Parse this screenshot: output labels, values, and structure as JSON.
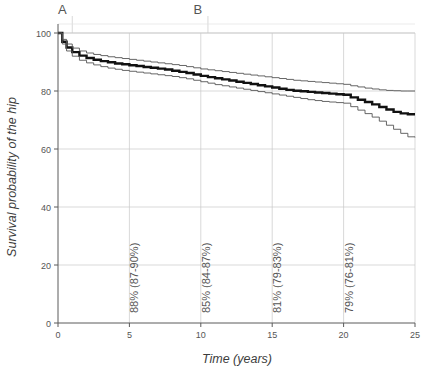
{
  "chart_data": {
    "type": "line",
    "title": "",
    "xlabel": "Time (years)",
    "ylabel": "Survival probability of the hip",
    "xlim": [
      0,
      25
    ],
    "ylim": [
      0,
      100
    ],
    "xticks": [
      0,
      5,
      10,
      15,
      20,
      25
    ],
    "yticks": [
      0,
      20,
      40,
      60,
      80,
      100
    ],
    "grid": true,
    "legend": "none",
    "panel_letters": [
      {
        "label": "A",
        "x": 1.0
      },
      {
        "label": "B",
        "x": 10.5
      }
    ],
    "annotations": [
      {
        "text": "88% (87-90%)",
        "x": 5,
        "value": 88,
        "ci_low": 87,
        "ci_high": 90
      },
      {
        "text": "85% (84-87%)",
        "x": 10,
        "value": 85,
        "ci_low": 84,
        "ci_high": 87
      },
      {
        "text": "81% (79-83%)",
        "x": 15,
        "value": 81,
        "ci_low": 79,
        "ci_high": 83
      },
      {
        "text": "79% (76-81%)",
        "x": 20,
        "value": 79,
        "ci_low": 76,
        "ci_high": 81
      }
    ],
    "series": [
      {
        "name": "Survival estimate",
        "style": "bold",
        "color": "#111111",
        "x": [
          0,
          0.3,
          0.6,
          1.0,
          1.5,
          2.0,
          2.5,
          3.0,
          3.5,
          4.0,
          4.5,
          5.0,
          5.5,
          6.0,
          6.5,
          7.0,
          7.5,
          8.0,
          8.5,
          9.0,
          9.5,
          10.0,
          10.5,
          11.0,
          11.5,
          12.0,
          12.5,
          13.0,
          13.5,
          14.0,
          14.5,
          15.0,
          15.5,
          16.0,
          16.5,
          17.0,
          17.5,
          18.0,
          18.5,
          19.0,
          19.5,
          20.0,
          20.5,
          21.0,
          21.5,
          22.0,
          22.5,
          23.0,
          23.5,
          24.0,
          24.5,
          25.0
        ],
        "values": [
          100,
          97.0,
          95.0,
          93.4,
          92.2,
          91.4,
          90.8,
          90.3,
          89.9,
          89.5,
          89.2,
          88.9,
          88.6,
          88.3,
          88.0,
          87.7,
          87.4,
          87.0,
          86.6,
          86.2,
          85.7,
          85.2,
          84.8,
          84.4,
          84.0,
          83.6,
          83.2,
          82.8,
          82.4,
          82.0,
          81.6,
          81.2,
          80.8,
          80.4,
          80.1,
          79.9,
          79.7,
          79.5,
          79.3,
          79.1,
          78.9,
          78.7,
          77.8,
          77.0,
          76.2,
          75.4,
          74.5,
          73.6,
          72.8,
          72.3,
          72.0,
          72.0
        ]
      },
      {
        "name": "Upper 95% CI",
        "style": "thin",
        "color": "#555555",
        "x": [
          0,
          0.3,
          0.6,
          1.0,
          1.5,
          2.0,
          2.5,
          3.0,
          3.5,
          4.0,
          4.5,
          5.0,
          5.5,
          6.0,
          6.5,
          7.0,
          7.5,
          8.0,
          8.5,
          9.0,
          9.5,
          10.0,
          10.5,
          11.0,
          11.5,
          12.0,
          12.5,
          13.0,
          13.5,
          14.0,
          14.5,
          15.0,
          15.5,
          16.0,
          16.5,
          17.0,
          17.5,
          18.0,
          18.5,
          19.0,
          19.5,
          20.0,
          20.5,
          21.0,
          21.5,
          22.0,
          22.5,
          23.0,
          23.5,
          24.0,
          24.5,
          25.0
        ],
        "values": [
          100,
          97.8,
          96.2,
          94.8,
          93.8,
          93.1,
          92.6,
          92.2,
          91.8,
          91.5,
          91.2,
          90.9,
          90.6,
          90.3,
          90.0,
          89.7,
          89.4,
          89.1,
          88.8,
          88.4,
          88.0,
          87.6,
          87.3,
          87.0,
          86.7,
          86.4,
          86.1,
          85.8,
          85.5,
          85.2,
          84.9,
          84.6,
          84.3,
          84.0,
          83.7,
          83.5,
          83.3,
          83.1,
          82.9,
          82.7,
          82.5,
          82.3,
          81.8,
          81.4,
          81.0,
          80.7,
          80.4,
          80.2,
          80.1,
          80.0,
          80.0,
          80.0
        ]
      },
      {
        "name": "Lower 95% CI",
        "style": "thin",
        "color": "#555555",
        "x": [
          0,
          0.3,
          0.6,
          1.0,
          1.5,
          2.0,
          2.5,
          3.0,
          3.5,
          4.0,
          4.5,
          5.0,
          5.5,
          6.0,
          6.5,
          7.0,
          7.5,
          8.0,
          8.5,
          9.0,
          9.5,
          10.0,
          10.5,
          11.0,
          11.5,
          12.0,
          12.5,
          13.0,
          13.5,
          14.0,
          14.5,
          15.0,
          15.5,
          16.0,
          16.5,
          17.0,
          17.5,
          18.0,
          18.5,
          19.0,
          19.5,
          20.0,
          20.5,
          21.0,
          21.5,
          22.0,
          22.5,
          23.0,
          23.5,
          24.0,
          24.5,
          25.0
        ],
        "values": [
          100,
          96.2,
          93.8,
          92.0,
          90.6,
          89.7,
          89.0,
          88.4,
          87.9,
          87.5,
          87.1,
          86.8,
          86.5,
          86.2,
          85.9,
          85.6,
          85.3,
          85.0,
          84.6,
          84.2,
          83.7,
          83.2,
          82.7,
          82.2,
          81.8,
          81.4,
          81.0,
          80.6,
          80.2,
          79.8,
          79.4,
          79.0,
          78.6,
          78.2,
          77.8,
          77.4,
          77.0,
          76.7,
          76.4,
          76.2,
          76.0,
          75.8,
          74.6,
          73.4,
          72.2,
          71.0,
          69.6,
          68.2,
          66.8,
          65.4,
          64.2,
          64.0
        ]
      }
    ]
  },
  "colors": {
    "grid": "#c8c8c8",
    "axis": "#5a5a5a",
    "text": "#4a4a4a",
    "curve_bold": "#111111",
    "curve_ci": "#555555",
    "background": "#ffffff"
  }
}
